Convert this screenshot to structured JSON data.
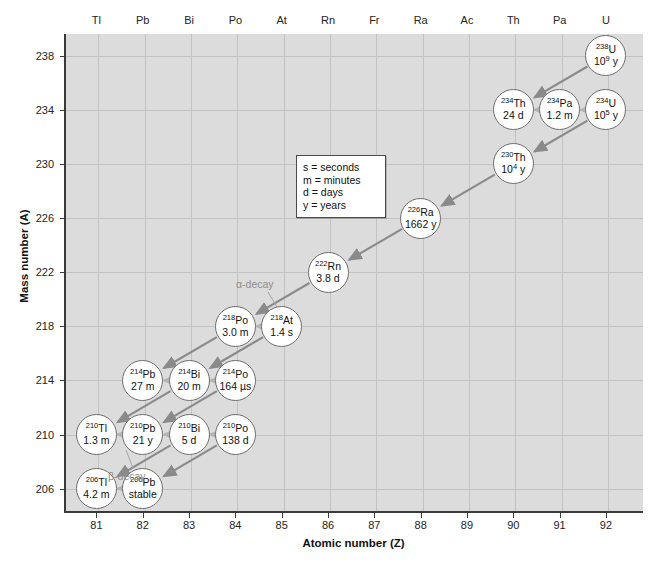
{
  "axes": {
    "x_title": "Atomic number (Z)",
    "y_title": "Mass number (A)",
    "x_ticks": [
      81,
      82,
      83,
      84,
      85,
      86,
      87,
      88,
      89,
      90,
      91,
      92
    ],
    "y_ticks": [
      238,
      234,
      230,
      226,
      222,
      218,
      214,
      210,
      206
    ],
    "element_symbols": [
      "Tl",
      "Pb",
      "Bi",
      "Po",
      "At",
      "Rn",
      "Fr",
      "Ra",
      "Ac",
      "Th",
      "Pa",
      "U"
    ]
  },
  "legend": {
    "lines": [
      "s = seconds",
      "m = minutes",
      "d = days",
      "y = years"
    ]
  },
  "annotations": {
    "alpha": "α-decay",
    "beta": "β-decay"
  },
  "chart_data": {
    "type": "scatter",
    "title": "",
    "xlabel": "Atomic number (Z)",
    "ylabel": "Mass number (A)",
    "xlim": [
      80.3,
      92.8
    ],
    "ylim": [
      204.2,
      239.6
    ],
    "grid": true,
    "legend_position": "inside-center",
    "nuclides": [
      {
        "symbol": "U",
        "mass": "238",
        "Z": 92,
        "A": 238,
        "half_life": "10",
        "half_life_exp": "9",
        "half_life_unit": "y"
      },
      {
        "symbol": "Th",
        "mass": "234",
        "Z": 90,
        "A": 234,
        "half_life": "24 d"
      },
      {
        "symbol": "Pa",
        "mass": "234",
        "Z": 91,
        "A": 234,
        "half_life": "1.2 m"
      },
      {
        "symbol": "U",
        "mass": "234",
        "Z": 92,
        "A": 234,
        "half_life": "10",
        "half_life_exp": "5",
        "half_life_unit": "y"
      },
      {
        "symbol": "Th",
        "mass": "230",
        "Z": 90,
        "A": 230,
        "half_life": "10",
        "half_life_exp": "4",
        "half_life_unit": "y"
      },
      {
        "symbol": "Ra",
        "mass": "226",
        "Z": 88,
        "A": 226,
        "half_life": "1662 y"
      },
      {
        "symbol": "Rn",
        "mass": "222",
        "Z": 86,
        "A": 222,
        "half_life": "3.8 d"
      },
      {
        "symbol": "Po",
        "mass": "218",
        "Z": 84,
        "A": 218,
        "half_life": "3.0 m"
      },
      {
        "symbol": "At",
        "mass": "218",
        "Z": 85,
        "A": 218,
        "half_life": "1.4 s"
      },
      {
        "symbol": "Pb",
        "mass": "214",
        "Z": 82,
        "A": 214,
        "half_life": "27 m"
      },
      {
        "symbol": "Bi",
        "mass": "214",
        "Z": 83,
        "A": 214,
        "half_life": "20 m"
      },
      {
        "symbol": "Po",
        "mass": "214",
        "Z": 84,
        "A": 214,
        "half_life": "164 µs"
      },
      {
        "symbol": "Tl",
        "mass": "210",
        "Z": 81,
        "A": 210,
        "half_life": "1.3 m"
      },
      {
        "symbol": "Pb",
        "mass": "210",
        "Z": 82,
        "A": 210,
        "half_life": "21 y"
      },
      {
        "symbol": "Bi",
        "mass": "210",
        "Z": 83,
        "A": 210,
        "half_life": "5 d"
      },
      {
        "symbol": "Po",
        "mass": "210",
        "Z": 84,
        "A": 210,
        "half_life": "138 d"
      },
      {
        "symbol": "Tl",
        "mass": "206",
        "Z": 81,
        "A": 206,
        "half_life": "4.2 m"
      },
      {
        "symbol": "Pb",
        "mass": "206",
        "Z": 82,
        "A": 206,
        "half_life": "stable"
      }
    ],
    "decays": [
      {
        "from": "238U",
        "to": "234Th",
        "type": "alpha"
      },
      {
        "from": "234Th",
        "to": "234Pa",
        "type": "beta"
      },
      {
        "from": "234Pa",
        "to": "234U",
        "type": "beta"
      },
      {
        "from": "234U",
        "to": "230Th",
        "type": "alpha"
      },
      {
        "from": "230Th",
        "to": "226Ra",
        "type": "alpha"
      },
      {
        "from": "226Ra",
        "to": "222Rn",
        "type": "alpha"
      },
      {
        "from": "222Rn",
        "to": "218Po",
        "type": "alpha"
      },
      {
        "from": "218Po",
        "to": "218At",
        "type": "beta"
      },
      {
        "from": "218Po",
        "to": "214Pb",
        "type": "alpha"
      },
      {
        "from": "218At",
        "to": "214Bi",
        "type": "alpha"
      },
      {
        "from": "214Pb",
        "to": "214Bi",
        "type": "beta"
      },
      {
        "from": "214Bi",
        "to": "214Po",
        "type": "beta"
      },
      {
        "from": "214Bi",
        "to": "210Tl",
        "type": "alpha"
      },
      {
        "from": "214Po",
        "to": "210Pb",
        "type": "alpha"
      },
      {
        "from": "210Tl",
        "to": "210Pb",
        "type": "beta"
      },
      {
        "from": "210Pb",
        "to": "210Bi",
        "type": "beta"
      },
      {
        "from": "210Bi",
        "to": "210Po",
        "type": "beta"
      },
      {
        "from": "210Bi",
        "to": "206Tl",
        "type": "alpha"
      },
      {
        "from": "210Po",
        "to": "206Pb",
        "type": "alpha"
      },
      {
        "from": "206Tl",
        "to": "206Pb",
        "type": "beta"
      }
    ],
    "colors": {
      "plot_background": "#dcdcdc",
      "gridline": "#c2c2c2",
      "alpha_arrow": "#8a8a8a",
      "beta_arrow": "#b4b4b4",
      "bubble_fill": "#ffffff",
      "bubble_stroke": "#6d6d6d",
      "axis": "#3a3a3a"
    }
  }
}
